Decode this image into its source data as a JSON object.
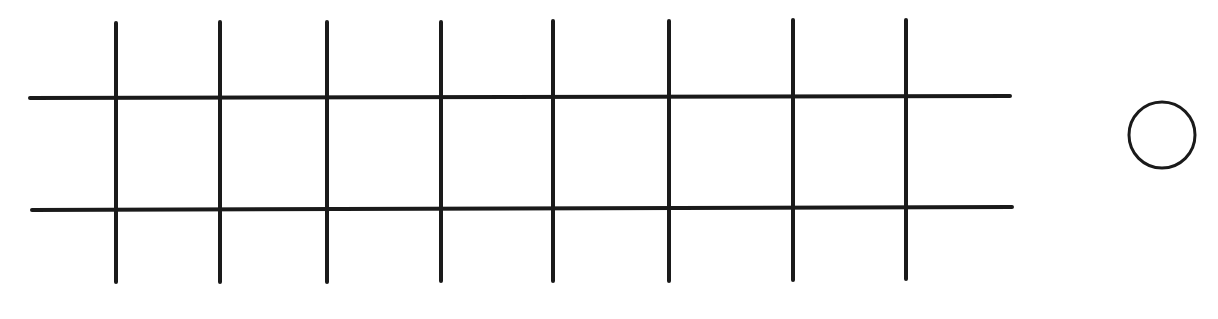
{
  "diagram": {
    "background": "#ffffff",
    "stroke_color": "#1a1a1a",
    "stroke_width": 4,
    "horizontal_lines": [
      {
        "y1": 98,
        "y2": 96,
        "x1": 30,
        "x2": 1010
      },
      {
        "y1": 210,
        "y2": 207,
        "x1": 32,
        "x2": 1012
      }
    ],
    "vertical_lines": [
      {
        "x": 116,
        "y1": 23,
        "y2": 282
      },
      {
        "x": 220,
        "y1": 22,
        "y2": 282
      },
      {
        "x": 327,
        "y1": 22,
        "y2": 282
      },
      {
        "x": 441,
        "y1": 22,
        "y2": 281
      },
      {
        "x": 553,
        "y1": 21,
        "y2": 281
      },
      {
        "x": 669,
        "y1": 21,
        "y2": 281
      },
      {
        "x": 793,
        "y1": 20,
        "y2": 280
      },
      {
        "x": 906,
        "y1": 20,
        "y2": 279
      }
    ],
    "circle": {
      "cx": 1162,
      "cy": 135,
      "r": 33,
      "stroke_width": 3
    }
  }
}
